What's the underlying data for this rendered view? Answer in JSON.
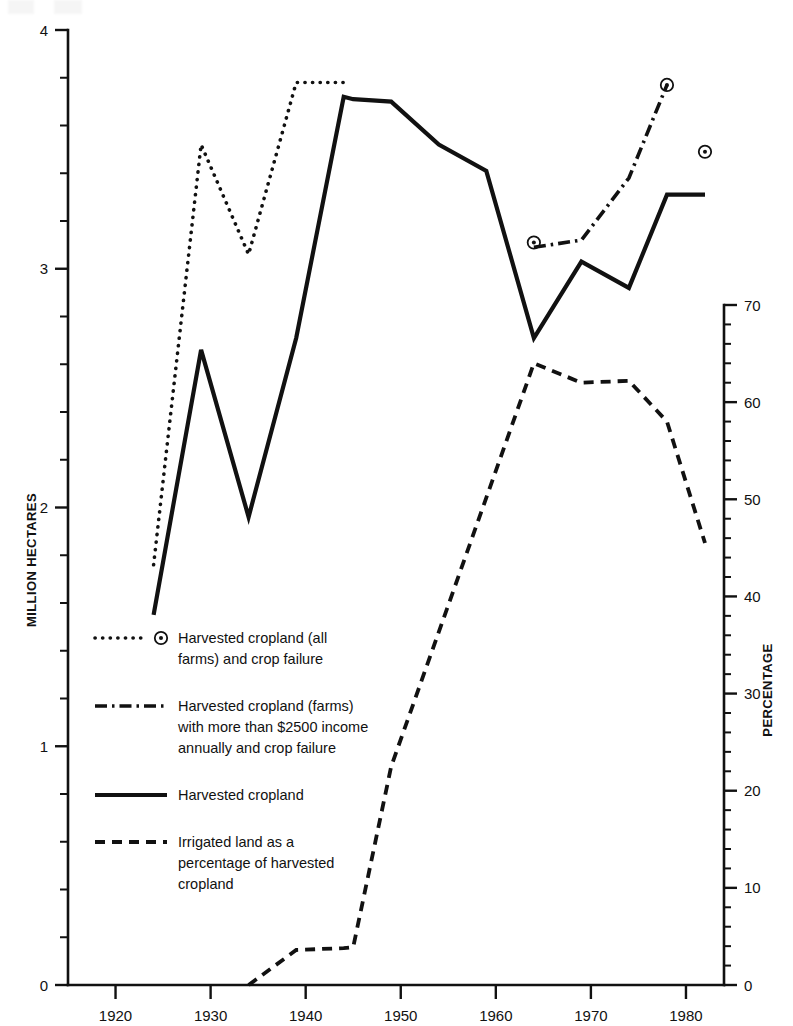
{
  "chart_data": {
    "type": "line",
    "title": "",
    "xlabel": "",
    "ylabel": "MILLION HECTARES",
    "y2label": "PERCENTAGE",
    "xlim": [
      1915,
      1984
    ],
    "ylim": [
      0,
      4
    ],
    "y2lim": [
      0,
      70
    ],
    "grid": false,
    "legend_position": "inside-lower-left",
    "x_ticks": [
      1920,
      1930,
      1940,
      1950,
      1960,
      1970,
      1980
    ],
    "x_tick_labels": [
      "1920",
      "1930",
      "1940",
      "1950",
      "1960",
      "1970",
      "1980"
    ],
    "y_ticks": [
      0,
      1,
      2,
      3,
      4
    ],
    "y_tick_labels": [
      "0",
      "1",
      "2",
      "3",
      "4"
    ],
    "y_minor_step": 0.2,
    "y2_ticks": [
      0,
      10,
      20,
      30,
      40,
      50,
      60,
      70
    ],
    "y2_tick_labels": [
      "0",
      "10",
      "20",
      "30",
      "40",
      "50",
      "60",
      "70"
    ],
    "y2_minor_step": 2,
    "series": [
      {
        "name": "Harvested cropland (all farms) and crop failure",
        "style": "dotted",
        "axis": "left",
        "marker": "circle-dot",
        "x": [
          1924,
          1929,
          1934,
          1939,
          1944
        ],
        "values": [
          1.76,
          3.52,
          3.06,
          3.78,
          3.78
        ],
        "marker_points": [
          {
            "x": 1964,
            "y": 3.11
          },
          {
            "x": 1978,
            "y": 3.77
          },
          {
            "x": 1982,
            "y": 3.49
          }
        ]
      },
      {
        "name": "Harvested cropland (farms) with more than $2500 income annually and crop failure",
        "style": "dash-dot",
        "axis": "left",
        "x": [
          1964,
          1969,
          1974,
          1978
        ],
        "values": [
          3.09,
          3.12,
          3.38,
          3.77
        ]
      },
      {
        "name": "Harvested cropland",
        "style": "solid",
        "axis": "left",
        "x": [
          1924,
          1929,
          1934,
          1939,
          1944,
          1945,
          1949,
          1954,
          1959,
          1964,
          1969,
          1974,
          1978,
          1982
        ],
        "values": [
          1.55,
          2.66,
          1.96,
          2.71,
          3.72,
          3.71,
          3.7,
          3.52,
          3.41,
          2.71,
          3.03,
          2.92,
          3.31,
          3.31
        ]
      },
      {
        "name": "Irrigated land as a percentage of harvested cropland",
        "style": "dashed",
        "axis": "right",
        "x": [
          1934,
          1939,
          1944,
          1945,
          1949,
          1964,
          1969,
          1974,
          1978,
          1982
        ],
        "values": [
          0,
          3.6,
          3.8,
          3.9,
          22.5,
          64.0,
          62.0,
          62.2,
          58.0,
          45.5
        ]
      }
    ],
    "annotations": []
  },
  "legend": {
    "entries": [
      {
        "style": "dotted-with-marker",
        "lines": [
          "Harvested cropland (all",
          "farms) and crop failure"
        ]
      },
      {
        "style": "dash-dot",
        "lines": [
          "Harvested cropland (farms)",
          "with more than $2500 income",
          "annually and crop failure"
        ]
      },
      {
        "style": "solid",
        "lines": [
          "Harvested cropland"
        ]
      },
      {
        "style": "dashed",
        "lines": [
          "Irrigated land as a",
          "percentage of harvested",
          "cropland"
        ]
      }
    ]
  },
  "axes": {
    "left_title": "MILLION HECTARES",
    "right_title": "PERCENTAGE"
  }
}
